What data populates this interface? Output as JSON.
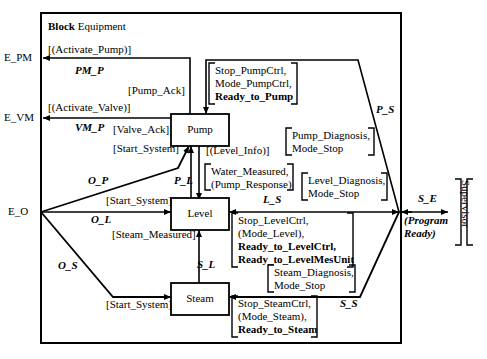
{
  "diagram": {
    "title_bold": "Block",
    "title_rest": " Equipment",
    "external_ports": {
      "e_pm": "E_PM",
      "e_vm": "E_VM",
      "e_o": "E_O",
      "s_e": "S_E",
      "supervisor": "Supervisor"
    },
    "blocks": {
      "pump": "Pump",
      "level": "Level",
      "steam": "Steam"
    },
    "channels": {
      "pm_p": "PM_P",
      "vm_p": "VM_P",
      "p_s": "P_S",
      "p_l": "P_L",
      "o_p": "O_P",
      "o_l": "O_L",
      "o_s": "O_S",
      "l_s": "L_S",
      "s_l": "S_L",
      "s_s": "S_S",
      "s_e": "S_E"
    },
    "signals": {
      "activate_pump": "[(Activate_Pump)]",
      "pump_ack": "[Pump_Ack]",
      "activate_valve": "[(Activate_Valve)]",
      "valve_ack": "[Valve_Ack]",
      "start_system_pump": "[Start_System]",
      "start_system_level": "[Start_System]",
      "start_system_steam": "[Start_System]",
      "level_info": "[(Level_Info)]",
      "steam_measured": "[Steam_Measured]",
      "program_ready_l1": "(Program",
      "program_ready_l2": "Ready)"
    },
    "groups": {
      "pump_ctrl": {
        "lines": [
          {
            "text": "Stop_PumpCtrl,",
            "bold": false
          },
          {
            "text": "Mode_PumpCtrl,",
            "bold": false
          },
          {
            "text": "Ready_to_Pump",
            "bold": true
          }
        ]
      },
      "pump_diagnosis": {
        "lines": [
          {
            "text": "Pump_Diagnosis,",
            "bold": false
          },
          {
            "text": "Mode_Stop",
            "bold": false
          }
        ]
      },
      "water_measured": {
        "lines": [
          {
            "text": "Water_Measured,",
            "bold": false
          },
          {
            "text": "(Pump_Response)",
            "bold": false
          }
        ]
      },
      "level_diagnosis": {
        "lines": [
          {
            "text": "Level_Diagnosis,",
            "bold": false
          },
          {
            "text": "Mode_Stop",
            "bold": false
          }
        ]
      },
      "level_ctrl": {
        "lines": [
          {
            "text": "Stop_LevelCtrl,",
            "bold": false
          },
          {
            "text": "(Mode_Level),",
            "bold": false
          },
          {
            "text": "Ready_to_LevelCtrl,",
            "bold": true
          },
          {
            "text": "Ready_to_LevelMesUnit",
            "bold": true
          }
        ]
      },
      "steam_diagnosis": {
        "lines": [
          {
            "text": "Steam_Diagnosis,",
            "bold": false
          },
          {
            "text": "Mode_Stop",
            "bold": false
          }
        ]
      },
      "steam_ctrl": {
        "lines": [
          {
            "text": "Stop_SteamCtrl,",
            "bold": false
          },
          {
            "text": "(Mode_Steam),",
            "bold": false
          },
          {
            "text": "Ready_to_Steam",
            "bold": true
          }
        ]
      }
    },
    "colors": {
      "line": "#000000",
      "background": "#ffffff"
    }
  }
}
